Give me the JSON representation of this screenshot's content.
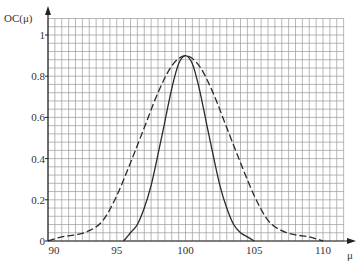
{
  "chart_data": {
    "type": "line",
    "title": "",
    "xlabel": "μ",
    "ylabel": "OC(μ)",
    "xlim": [
      90,
      111.5
    ],
    "ylim": [
      0,
      1.08
    ],
    "grid": true,
    "legend": null,
    "x_ticks": [
      90,
      95,
      100,
      105,
      110
    ],
    "x_tick_labels": [
      "90",
      "95",
      "100",
      "105",
      "110"
    ],
    "y_ticks": [
      0,
      0.2,
      0.4,
      0.6,
      0.8,
      1
    ],
    "y_tick_labels": [
      "0",
      "0.2",
      "0.4",
      "0.6",
      "0.8",
      "1"
    ],
    "series": [
      {
        "name": "solid curve (narrow)",
        "style": "solid",
        "x": [
          95.5,
          96,
          96.5,
          97,
          97.5,
          98,
          98.5,
          99,
          99.5,
          100,
          100.5,
          101,
          101.5,
          102,
          102.5,
          103,
          103.5,
          104,
          104.5,
          105
        ],
        "values": [
          0.0,
          0.04,
          0.08,
          0.16,
          0.27,
          0.42,
          0.58,
          0.74,
          0.86,
          0.9,
          0.86,
          0.74,
          0.58,
          0.42,
          0.27,
          0.16,
          0.08,
          0.04,
          0.02,
          0.0
        ]
      },
      {
        "name": "dashed curve (wide)",
        "style": "dashed",
        "x": [
          90,
          91,
          92,
          93,
          94,
          95,
          96,
          97,
          98,
          99,
          100,
          101,
          102,
          103,
          104,
          105,
          106,
          107,
          108,
          109,
          110
        ],
        "values": [
          0.0,
          0.02,
          0.03,
          0.05,
          0.1,
          0.22,
          0.38,
          0.55,
          0.72,
          0.85,
          0.9,
          0.85,
          0.72,
          0.55,
          0.38,
          0.22,
          0.1,
          0.05,
          0.03,
          0.02,
          0.0
        ]
      }
    ]
  },
  "colors": {
    "grid": "#9a9a9a",
    "axis": "#222222",
    "curve": "#2a2a2a",
    "text": "#333333"
  }
}
